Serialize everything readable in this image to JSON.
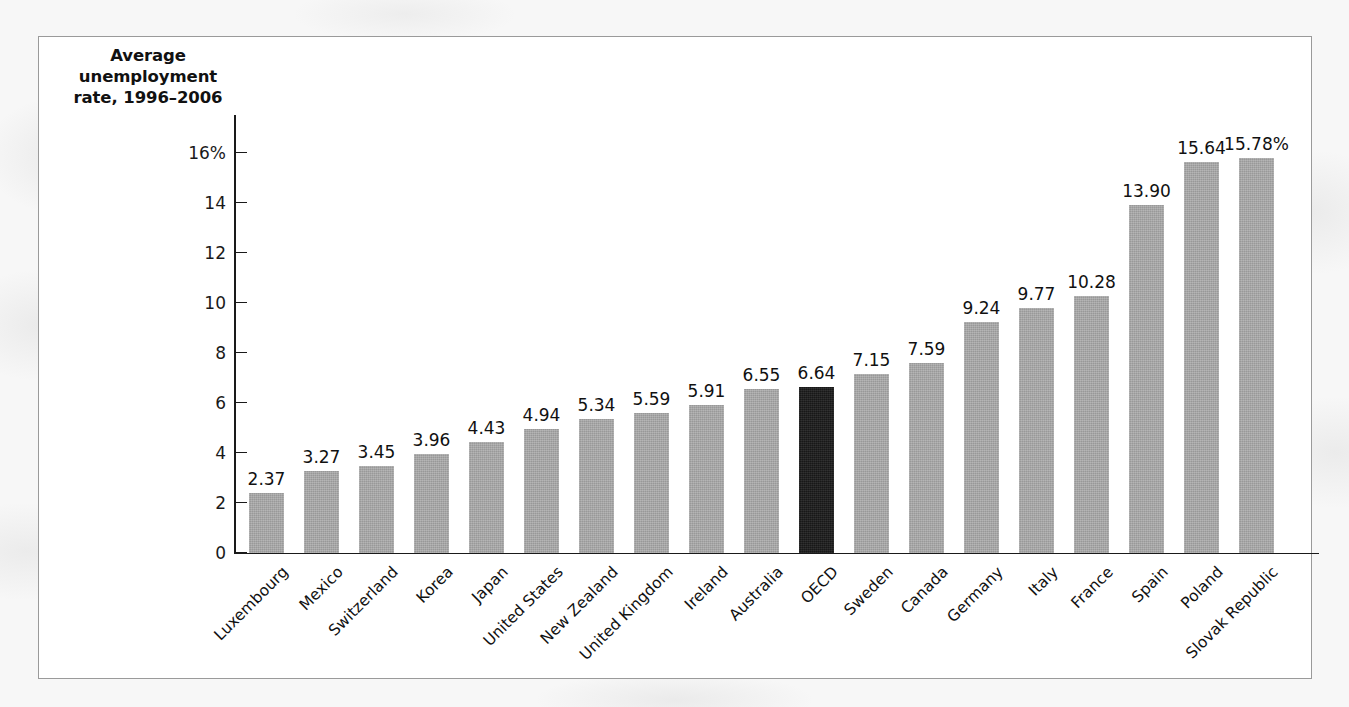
{
  "chart_data": {
    "type": "bar",
    "title": "Average unemployment rate, 1996–2006",
    "xlabel": "",
    "ylabel": "Average unemployment rate, 1996–2006",
    "ylim": [
      0,
      16
    ],
    "grid": false,
    "legend": "none",
    "y_ticks": [
      {
        "value": 16,
        "label": "16%"
      },
      {
        "value": 14,
        "label": "14"
      },
      {
        "value": 12,
        "label": "12"
      },
      {
        "value": 10,
        "label": "10"
      },
      {
        "value": 8,
        "label": "8"
      },
      {
        "value": 6,
        "label": "6"
      },
      {
        "value": 4,
        "label": "4"
      },
      {
        "value": 2,
        "label": "2"
      },
      {
        "value": 0,
        "label": "0"
      }
    ],
    "categories": [
      "Luxembourg",
      "Mexico",
      "Switzerland",
      "Korea",
      "Japan",
      "United States",
      "New Zealand",
      "United Kingdom",
      "Ireland",
      "Australia",
      "OECD",
      "Sweden",
      "Canada",
      "Germany",
      "Italy",
      "France",
      "Spain",
      "Poland",
      "Slovak Republic"
    ],
    "values": [
      2.37,
      3.27,
      3.45,
      3.96,
      4.43,
      4.94,
      5.34,
      5.59,
      5.91,
      6.55,
      6.64,
      7.15,
      7.59,
      9.24,
      9.77,
      10.28,
      13.9,
      15.64,
      15.78
    ],
    "value_labels": [
      "2.37",
      "3.27",
      "3.45",
      "3.96",
      "4.43",
      "4.94",
      "5.34",
      "5.59",
      "5.91",
      "6.55",
      "6.64",
      "7.15",
      "7.59",
      "9.24",
      "9.77",
      "10.28",
      "13.90",
      "15.64",
      "15.78%"
    ],
    "highlight_category": "OECD",
    "colors": {
      "bar": "#a6a6a6",
      "highlight_bar": "#1d1d1d",
      "axis": "#1a1a1a",
      "text": "#111111",
      "frame_border": "#9a9a9a",
      "figure_background": "#ffffff",
      "page_background": "#f7f7f7"
    }
  }
}
